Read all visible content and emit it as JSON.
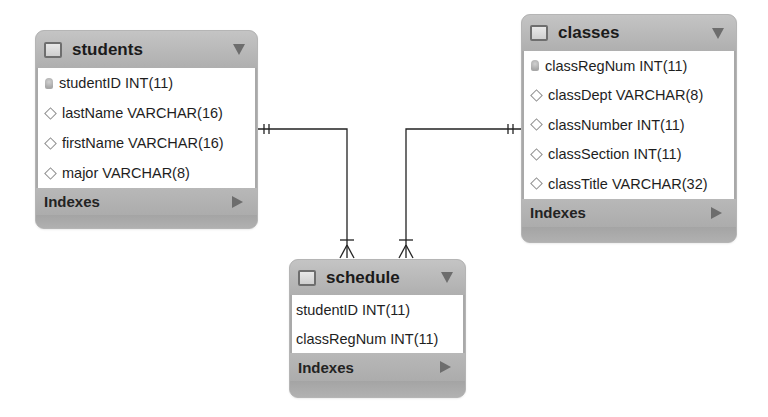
{
  "tables": {
    "students": {
      "name": "students",
      "columns": [
        {
          "label": "studentID INT(11)",
          "icon": "primary-key-icon"
        },
        {
          "label": "lastName VARCHAR(16)",
          "icon": "column-diamond-icon"
        },
        {
          "label": "firstName VARCHAR(16)",
          "icon": "column-diamond-icon"
        },
        {
          "label": "major VARCHAR(8)",
          "icon": "column-diamond-icon"
        }
      ],
      "indexes_label": "Indexes"
    },
    "classes": {
      "name": "classes",
      "columns": [
        {
          "label": "classRegNum INT(11)",
          "icon": "primary-key-icon"
        },
        {
          "label": "classDept VARCHAR(8)",
          "icon": "column-diamond-icon"
        },
        {
          "label": "classNumber INT(11)",
          "icon": "column-diamond-icon"
        },
        {
          "label": "classSection INT(11)",
          "icon": "column-diamond-icon"
        },
        {
          "label": "classTitle VARCHAR(32)",
          "icon": "column-diamond-icon"
        }
      ],
      "indexes_label": "Indexes"
    },
    "schedule": {
      "name": "schedule",
      "columns": [
        {
          "label": "studentID INT(11)",
          "icon": "none"
        },
        {
          "label": "classRegNum INT(11)",
          "icon": "none"
        }
      ],
      "indexes_label": "Indexes"
    }
  },
  "relationships": [
    {
      "from": "students",
      "to": "schedule",
      "from_cardinality": "one-and-only-one",
      "to_cardinality": "one-or-many"
    },
    {
      "from": "classes",
      "to": "schedule",
      "from_cardinality": "one-and-only-one",
      "to_cardinality": "one-or-many"
    }
  ],
  "colors": {
    "header": "#b5b5b5",
    "body": "#ffffff",
    "line": "#222222"
  }
}
